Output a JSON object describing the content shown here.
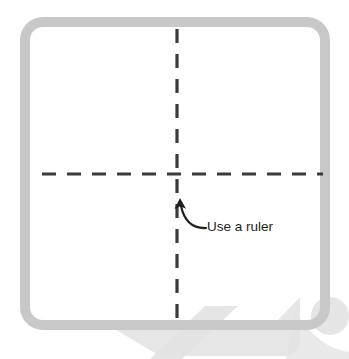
{
  "diagram": {
    "canvas": {
      "width": 349,
      "height": 359,
      "background": "#ffffff"
    },
    "frame": {
      "name": "rounded-square-frame",
      "stroke_color": "#c8c8c8",
      "stroke_width": 10,
      "corner_radius": 18,
      "x": 25,
      "y": 22,
      "width": 300,
      "height": 303
    },
    "guides": {
      "stroke_color": "#3b3b3b",
      "stroke_width": 3.2,
      "dash_length": 14,
      "dash_gap": 11,
      "vertical": {
        "name": "vertical-center-guide",
        "x": 177,
        "y1": 29,
        "y2": 319
      },
      "horizontal": {
        "name": "horizontal-center-guide",
        "y": 174,
        "x1": 42,
        "x2": 323
      }
    },
    "annotation": {
      "name": "use-a-ruler-annotation",
      "label": "Use a ruler",
      "text_color": "#231f20",
      "font_size": 13.5,
      "text_x": 207,
      "text_y": 227,
      "arrow": {
        "name": "curved-arrow",
        "stroke_color": "#231f20",
        "stroke_width": 2.2,
        "tip_x": 180,
        "tip_y": 199,
        "tail_x": 206,
        "tail_y": 228
      }
    },
    "watermark": {
      "name": "corner-watermark",
      "color": "#e2e2e2",
      "position": "bottom-right"
    }
  }
}
